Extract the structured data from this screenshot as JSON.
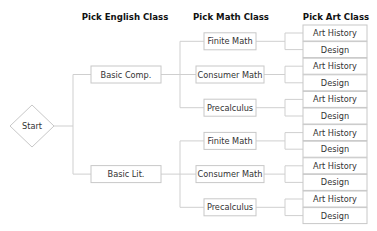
{
  "headers": {
    "english": "Pick English Class",
    "math": "Pick Math Class",
    "art": "Pick Art Class"
  },
  "start": {
    "label": "Start"
  },
  "tree": [
    {
      "label": "Basic Comp.",
      "children": [
        {
          "label": "Finite Math",
          "children": [
            "Art History",
            "Design"
          ]
        },
        {
          "label": "Consumer Math",
          "children": [
            "Art History",
            "Design"
          ]
        },
        {
          "label": "Precalculus",
          "children": [
            "Art History",
            "Design"
          ]
        }
      ]
    },
    {
      "label": "Basic Lit.",
      "children": [
        {
          "label": "Finite Math",
          "children": [
            "Art History",
            "Design"
          ]
        },
        {
          "label": "Consumer Math",
          "children": [
            "Art History",
            "Design"
          ]
        },
        {
          "label": "Precalculus",
          "children": [
            "Art History",
            "Design"
          ]
        }
      ]
    }
  ],
  "colors": {
    "line": "#cfcfcf",
    "box_border": "#c8c8c8",
    "text": "#333333",
    "header": "#111111"
  }
}
